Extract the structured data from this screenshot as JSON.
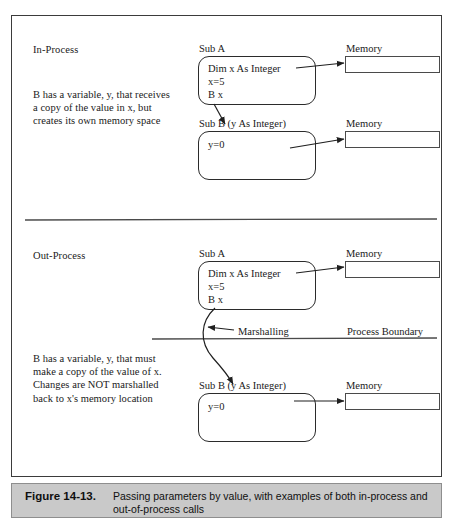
{
  "figure": {
    "caption_number": "Figure 14-13.",
    "caption_line1": "Passing parameters by value, with examples of both in-process and",
    "caption_line2": "out-of-process calls",
    "frame_color": "#3b3b3b",
    "caption_bar_color": "#c9c9c9"
  },
  "in_process": {
    "section_label": "In-Process",
    "description": "B has a variable, y, that receives a copy of the value in x, but creates its own memory space",
    "sub_a": {
      "title": "Sub A",
      "code": [
        "Dim x As Integer",
        "x=5",
        "B x"
      ]
    },
    "sub_b": {
      "title": "Sub B (y As Integer)",
      "code": [
        "y=0"
      ]
    },
    "memory_a_label": "Memory",
    "memory_b_label": "Memory"
  },
  "out_process": {
    "section_label": "Out-Process",
    "description": "B has a variable, y, that must make a copy of the value of x. Changes are NOT marshalled back to x's memory location",
    "sub_a": {
      "title": "Sub A",
      "code": [
        "Dim x As Integer",
        "x=5",
        "B x"
      ]
    },
    "sub_b": {
      "title": "Sub B (y As Integer)",
      "code": [
        "y=0"
      ]
    },
    "memory_a_label": "Memory",
    "memory_b_label": "Memory",
    "marshalling_label": "Marshalling",
    "process_boundary_label": "Process Boundary"
  }
}
